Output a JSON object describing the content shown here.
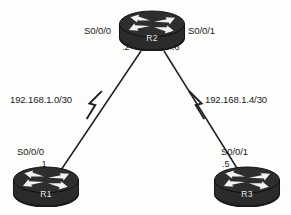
{
  "diagram": {
    "type": "network-topology",
    "title": "",
    "background_color": "#fdfdfc",
    "line_color": "#1f1f1f",
    "device_color": "#2b2b2b",
    "label_color": "#1a1a1a"
  },
  "devices": [
    {
      "id": "r2",
      "name": "R2",
      "icon": "router-icon",
      "x": 152,
      "y": 28,
      "interfaces": [
        {
          "name": "S0/0/0",
          "address": ".2",
          "side": "left"
        },
        {
          "name": "S0/0/1",
          "address": ".6",
          "side": "right"
        }
      ]
    },
    {
      "id": "r1",
      "name": "R1",
      "icon": "router-icon",
      "x": 44,
      "y": 186,
      "interfaces": [
        {
          "name": "S0/0/0",
          "address": ".1",
          "side": "top"
        }
      ]
    },
    {
      "id": "r3",
      "name": "R3",
      "icon": "router-icon",
      "x": 245,
      "y": 186,
      "interfaces": [
        {
          "name": "S0/0/1",
          "address": ".5",
          "side": "top"
        }
      ]
    }
  ],
  "links": [
    {
      "id": "link-r1-r2",
      "from": "r1",
      "to": "r2",
      "network": "192.168.1.0/30",
      "type": "serial",
      "symbol": "lightning-bolt"
    },
    {
      "id": "link-r2-r3",
      "from": "r2",
      "to": "r3",
      "network": "192.168.1.4/30",
      "type": "serial",
      "symbol": "lightning-bolt"
    }
  ],
  "labels": {
    "r2_left_interface": "S0/0/0",
    "r2_right_interface": "S0/0/1",
    "r2_left_address": ".2",
    "r2_right_address": ".6",
    "r1_interface": "S0/0/0",
    "r1_address": ".1",
    "r3_interface": "S0/0/1",
    "r3_address": ".5",
    "left_network": "192.168.1.0/30",
    "right_network": "192.168.1.4/30",
    "r1_name": "R1",
    "r2_name": "R2",
    "r3_name": "R3"
  }
}
